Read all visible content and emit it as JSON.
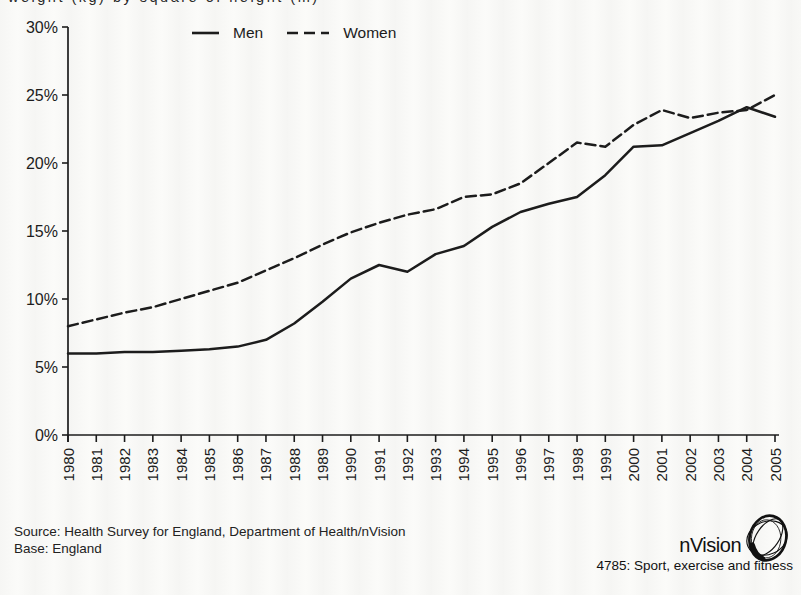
{
  "page": {
    "title_clipped": "weight (kg) by square of height (m)",
    "ink_color": "#1c1c1c",
    "background_color": "#fafaf8"
  },
  "legend": {
    "men_label": "Men",
    "women_label": "Women"
  },
  "footer": {
    "source_line": "Source: Health Survey for England, Department of Health/nVision",
    "base_line": "Base: England"
  },
  "branding": {
    "logo_text": "nVision",
    "caption": "4785: Sport, exercise and fitness"
  },
  "chart_data": {
    "type": "line",
    "x": [
      1980,
      1981,
      1982,
      1983,
      1984,
      1985,
      1986,
      1987,
      1988,
      1989,
      1990,
      1991,
      1992,
      1993,
      1994,
      1995,
      1996,
      1997,
      1998,
      1999,
      2000,
      2001,
      2002,
      2003,
      2004,
      2005
    ],
    "series": [
      {
        "name": "Men",
        "style": "solid",
        "values": [
          6.0,
          6.0,
          6.1,
          6.1,
          6.2,
          6.3,
          6.5,
          7.0,
          8.2,
          9.8,
          11.5,
          12.5,
          12.0,
          13.3,
          13.9,
          15.3,
          16.4,
          17.0,
          17.5,
          19.1,
          21.2,
          21.3,
          22.2,
          23.1,
          24.1,
          23.4
        ]
      },
      {
        "name": "Women",
        "style": "dashed",
        "values": [
          8.0,
          8.5,
          9.0,
          9.4,
          10.0,
          10.6,
          11.2,
          12.1,
          13.0,
          14.0,
          14.9,
          15.6,
          16.2,
          16.6,
          17.5,
          17.7,
          18.5,
          20.0,
          21.5,
          21.2,
          22.8,
          23.9,
          23.3,
          23.7,
          23.9,
          25.0
        ]
      }
    ],
    "yticks": [
      0,
      5,
      10,
      15,
      20,
      25,
      30
    ],
    "ytick_labels": [
      "0%",
      "5%",
      "10%",
      "15%",
      "20%",
      "25%",
      "30%"
    ],
    "ylim": [
      0,
      30
    ],
    "grid": false,
    "legend_position": "top",
    "title": "",
    "xlabel": "",
    "ylabel": ""
  }
}
